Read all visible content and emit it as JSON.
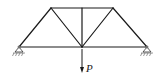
{
  "diagram": {
    "type": "truss",
    "nodes": {
      "A": [
        19,
        47
      ],
      "B": [
        51,
        8
      ],
      "C": [
        82,
        8
      ],
      "D": [
        113,
        8
      ],
      "E": [
        147,
        47
      ],
      "F": [
        82,
        47
      ]
    },
    "members": [
      [
        "A",
        "B"
      ],
      [
        "B",
        "C"
      ],
      [
        "C",
        "D"
      ],
      [
        "D",
        "E"
      ],
      [
        "A",
        "F"
      ],
      [
        "F",
        "E"
      ],
      [
        "B",
        "F"
      ],
      [
        "C",
        "F"
      ],
      [
        "D",
        "F"
      ]
    ],
    "supports": [
      {
        "node": "A",
        "type": "pin"
      },
      {
        "node": "E",
        "type": "roller"
      }
    ],
    "load": {
      "node": "F",
      "direction": "down",
      "label": "P"
    }
  }
}
